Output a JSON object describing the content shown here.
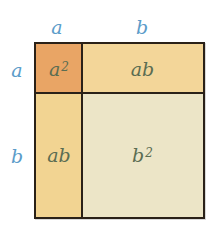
{
  "diagram": {
    "top_labels": [
      {
        "text": "a"
      },
      {
        "text": "b"
      }
    ],
    "left_labels": [
      {
        "text": "a"
      },
      {
        "text": "b"
      }
    ],
    "cells": {
      "top_left": {
        "base": "a",
        "exponent": "2",
        "color": "#e9a565"
      },
      "top_right": {
        "text": "ab",
        "color": "#f3d699"
      },
      "bottom_left": {
        "text": "ab",
        "color": "#f2d492"
      },
      "bottom_right": {
        "base": "b",
        "exponent": "2",
        "color": "#ece5c7"
      }
    },
    "colors": {
      "label_color": "#5b9cc9",
      "cell_text_color": "#5b6d52",
      "border_color": "#2a2118"
    }
  }
}
